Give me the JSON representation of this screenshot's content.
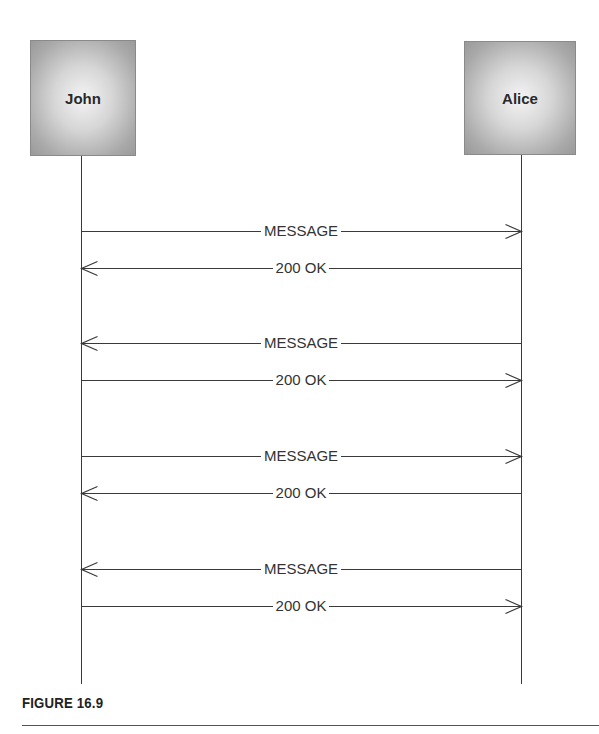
{
  "diagram": {
    "type": "sequence",
    "actors": [
      {
        "id": "john",
        "label": "John"
      },
      {
        "id": "alice",
        "label": "Alice"
      }
    ],
    "messages": [
      {
        "label": "MESSAGE",
        "from": "John",
        "to": "Alice",
        "y": 231
      },
      {
        "label": "200 OK",
        "from": "Alice",
        "to": "John",
        "y": 268
      },
      {
        "label": "MESSAGE",
        "from": "Alice",
        "to": "John",
        "y": 343
      },
      {
        "label": "200 OK",
        "from": "John",
        "to": "Alice",
        "y": 380
      },
      {
        "label": "MESSAGE",
        "from": "John",
        "to": "Alice",
        "y": 456
      },
      {
        "label": "200 OK",
        "from": "Alice",
        "to": "John",
        "y": 493
      },
      {
        "label": "MESSAGE",
        "from": "Alice",
        "to": "John",
        "y": 569
      },
      {
        "label": "200 OK",
        "from": "John",
        "to": "Alice",
        "y": 606
      }
    ]
  },
  "caption": {
    "label": "FIGURE 16.9"
  },
  "colors": {
    "line": "#3a3a3a",
    "text": "#333333",
    "box_border": "#8a8a8a"
  }
}
